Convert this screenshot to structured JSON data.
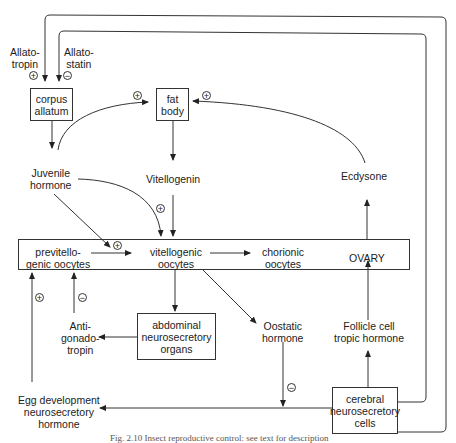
{
  "diagram": {
    "nodes": {
      "allatotropin": "Allato-\ntropin",
      "allatostatin": "Allato-\nstatin",
      "corpus_allatum": "corpus\nallatum",
      "fat_body": "fat\nbody",
      "juvenile_hormone": "Juvenile\nhormone",
      "vitellogenin": "Vitellogenin",
      "ecdysone": "Ecdysone",
      "previtellogenic_oocytes": "previtello-\ngenic oocytes",
      "vitellogenic_oocytes": "vitellogenic\noocytes",
      "chorionic_oocytes": "chorionic\noocytes",
      "ovary": "OVARY",
      "antigonadotropin": "Anti-\ngonado-\ntropin",
      "abdominal_neurosecretory_organs": "abdominal\nneurosecretory\norgans",
      "oostatic_hormone": "Oostatic\nhormone",
      "follicle_cell_tropic_hormone": "Follicle cell\ntropic hormone",
      "egg_development_neurosecretory_hormone": "Egg development\nneurosecretory\nhormone",
      "cerebral_neurosecretory_cells": "cerebral\nneurosecretory\ncells"
    },
    "signs": {
      "plus": "+",
      "minus": "−"
    },
    "edges": [
      {
        "from": "cerebral_neurosecretory_cells",
        "to": "corpus_allatum",
        "via": "Allatotropin",
        "sign": "+"
      },
      {
        "from": "cerebral_neurosecretory_cells",
        "to": "corpus_allatum",
        "via": "Allatostatin",
        "sign": "-"
      },
      {
        "from": "corpus_allatum",
        "to": "juvenile_hormone"
      },
      {
        "from": "juvenile_hormone",
        "to": "fat_body",
        "sign": "+"
      },
      {
        "from": "ecdysone",
        "to": "fat_body",
        "sign": "+"
      },
      {
        "from": "fat_body",
        "to": "vitellogenin"
      },
      {
        "from": "vitellogenin",
        "to": "vitellogenic_oocytes"
      },
      {
        "from": "juvenile_hormone",
        "to": "vitellogenic_oocytes",
        "sign": "+"
      },
      {
        "from": "juvenile_hormone",
        "to": "previtellogenic_oocytes",
        "sign": "+"
      },
      {
        "from": "previtellogenic_oocytes",
        "to": "vitellogenic_oocytes"
      },
      {
        "from": "vitellogenic_oocytes",
        "to": "chorionic_oocytes"
      },
      {
        "from": "ovary",
        "to": "ecdysone"
      },
      {
        "from": "vitellogenic_oocytes",
        "to": "abdominal_neurosecretory_organs"
      },
      {
        "from": "abdominal_neurosecretory_organs",
        "to": "antigonadotropin"
      },
      {
        "from": "antigonadotropin",
        "to": "previtellogenic_oocytes",
        "sign": "-"
      },
      {
        "from": "vitellogenic_oocytes",
        "to": "oostatic_hormone"
      },
      {
        "from": "oostatic_hormone",
        "to": "egg_development_pathway",
        "sign": "-"
      },
      {
        "from": "cerebral_neurosecretory_cells",
        "to": "egg_development_neurosecretory_hormone"
      },
      {
        "from": "egg_development_neurosecretory_hormone",
        "to": "previtellogenic_oocytes",
        "sign": "+"
      },
      {
        "from": "cerebral_neurosecretory_cells",
        "to": "follicle_cell_tropic_hormone"
      },
      {
        "from": "follicle_cell_tropic_hormone",
        "to": "ovary"
      }
    ],
    "caption": "Fig. 2.10 Insect reproductive control: see text for description"
  }
}
